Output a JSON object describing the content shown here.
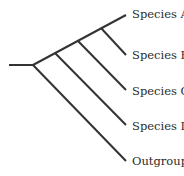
{
  "diagram": {
    "type": "cladogram",
    "line_color": "#333333",
    "taxa": [
      {
        "label": "Species A",
        "tip": [
          126,
          15
        ],
        "label_pos": [
          132,
          9
        ]
      },
      {
        "label": "Species B",
        "tip": [
          126,
          55
        ],
        "label_pos": [
          132,
          50
        ]
      },
      {
        "label": "Species C",
        "tip": [
          126,
          90
        ],
        "label_pos": [
          132,
          86
        ]
      },
      {
        "label": "Species D",
        "tip": [
          126,
          125
        ],
        "label_pos": [
          132,
          121
        ]
      },
      {
        "label": "Outgroup",
        "tip": [
          126,
          161
        ],
        "label_pos": [
          132,
          157
        ]
      }
    ],
    "nodes": {
      "root_stem_start": [
        9,
        65
      ],
      "root": [
        33,
        65
      ],
      "node_D": [
        55,
        52
      ],
      "node_C": [
        78,
        40
      ],
      "node_B": [
        101,
        29
      ]
    }
  }
}
